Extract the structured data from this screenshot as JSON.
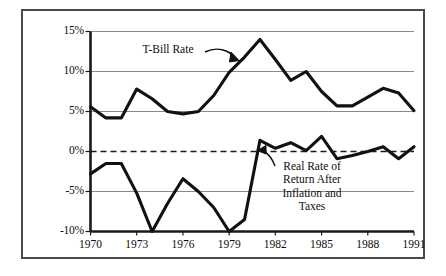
{
  "chart_data": {
    "type": "line",
    "title": "",
    "subtitle": "",
    "xlabel": "",
    "ylabel": "",
    "xlim": [
      1970,
      1991
    ],
    "ylim": [
      -10,
      15
    ],
    "yticks": [
      15,
      10,
      5,
      0,
      -5,
      -10
    ],
    "ytick_labels": [
      "15%",
      "10%",
      "5%",
      "0%",
      "-5%",
      "-10%"
    ],
    "xticks": [
      1970,
      1973,
      1976,
      1979,
      1982,
      1985,
      1988,
      1991
    ],
    "xtick_labels": [
      "1970",
      "1973",
      "1976",
      "1979",
      "1982",
      "1985",
      "1988",
      "1991"
    ],
    "grid": true,
    "gridlines_y": [
      15,
      10,
      5,
      -5,
      -10
    ],
    "zero_line": {
      "value": 0,
      "style": "dashed"
    },
    "legend": "annotations",
    "legend_position": "inline-annotations",
    "x": [
      1970,
      1971,
      1972,
      1973,
      1974,
      1975,
      1976,
      1977,
      1978,
      1979,
      1980,
      1981,
      1982,
      1983,
      1984,
      1985,
      1986,
      1987,
      1988,
      1989,
      1990,
      1991
    ],
    "series": [
      {
        "name": "T-Bill Rate",
        "color": "#111111",
        "values": [
          5.6,
          4.2,
          4.2,
          7.8,
          6.6,
          5.0,
          4.7,
          5.0,
          7.0,
          9.9,
          11.8,
          14.0,
          11.5,
          8.9,
          10.0,
          7.5,
          5.7,
          5.7,
          6.8,
          7.9,
          7.3,
          5.1
        ]
      },
      {
        "name": "Real Rate of Return After Inflation and Taxes",
        "color": "#111111",
        "values": [
          -2.8,
          -1.5,
          -1.5,
          -5.2,
          -10.0,
          -6.5,
          -3.4,
          -5.0,
          -7.0,
          -10.0,
          -8.5,
          1.4,
          0.4,
          1.1,
          0.1,
          1.9,
          -0.9,
          -0.5,
          0.0,
          0.6,
          -0.9,
          0.6
        ]
      }
    ],
    "annotations": [
      {
        "id": "tbill",
        "text": "T-Bill Rate",
        "lines": [
          "T-Bill Rate"
        ],
        "arrow": "curved-down-right",
        "points_to_year": 1981
      },
      {
        "id": "realrate",
        "text": "Real Rate of Return After Inflation and Taxes",
        "lines": [
          "Real Rate of",
          "Return After",
          "Inflation and",
          "Taxes"
        ],
        "arrow": "curved-up-left",
        "points_to_year": 1982
      }
    ],
    "colors": {
      "line": "#111111",
      "grid": "#8a8a8a",
      "axis": "#1a1a1a",
      "border": "#4a4a4a",
      "background": "#ffffff",
      "text": "#0d0d0d"
    }
  }
}
